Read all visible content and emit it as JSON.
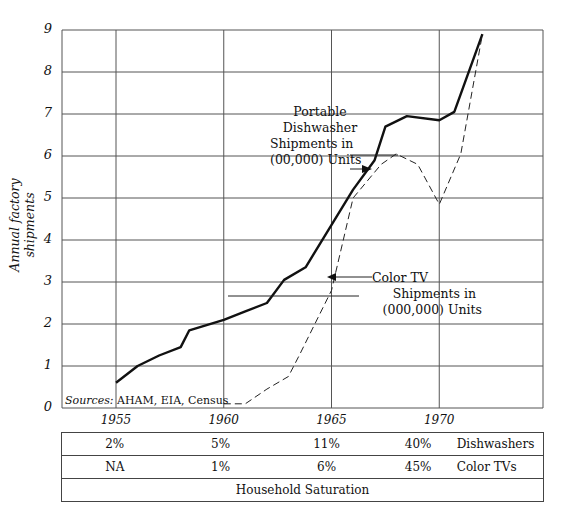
{
  "chart_data": {
    "type": "line",
    "title": "",
    "ylabel": "Annual factory shipments",
    "xlabel": "",
    "ylim": [
      0,
      9
    ],
    "xlim": [
      1952.5,
      1974.8
    ],
    "y_ticks": [
      "0",
      "1",
      "2",
      "3",
      "4",
      "5",
      "6",
      "7",
      "8",
      "9"
    ],
    "x_ticks": [
      "1955",
      "1960",
      "1965",
      "1970"
    ],
    "grid": true,
    "series": [
      {
        "name": "Portable Dishwasher Shipments in (00,000) Units",
        "style": "solid",
        "x": [
          1955,
          1956,
          1957,
          1958,
          1958.4,
          1960,
          1961,
          1962,
          1962.8,
          1963.8,
          1966,
          1967,
          1967.5,
          1968.5,
          1970,
          1970.7,
          1972
        ],
        "values": [
          0.6,
          1.0,
          1.25,
          1.45,
          1.85,
          2.1,
          2.3,
          2.5,
          3.05,
          3.35,
          5.2,
          5.9,
          6.7,
          6.95,
          6.85,
          7.05,
          8.9
        ]
      },
      {
        "name": "Color TV Shipments in (000,000) Units",
        "style": "dashed",
        "x": [
          1960,
          1961,
          1962,
          1963,
          1963.5,
          1965,
          1966,
          1967.3,
          1968,
          1969,
          1970,
          1971,
          1972
        ],
        "values": [
          0.1,
          0.1,
          0.45,
          0.75,
          1.25,
          2.8,
          5.0,
          5.8,
          6.05,
          5.8,
          4.85,
          6.05,
          8.9
        ]
      }
    ],
    "annotations": [
      {
        "lines": [
          "Portable",
          "Dishwasher",
          "Shipments in",
          "(00,000) Units"
        ]
      },
      {
        "lines": [
          "Color TV",
          "Shipments in",
          "(000,000) Units"
        ]
      }
    ],
    "source_label": "Sources:",
    "source_text": "AHAM, EIA, Census"
  },
  "table": {
    "rows": [
      {
        "values": [
          "2%",
          "5%",
          "11%",
          "40%"
        ],
        "label": "Dishwashers"
      },
      {
        "values": [
          "NA",
          "1%",
          "6%",
          "45%"
        ],
        "label": "Color TVs"
      }
    ],
    "footer": "Household Saturation"
  }
}
